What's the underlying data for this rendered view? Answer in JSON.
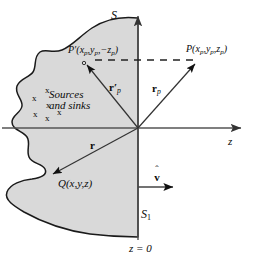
{
  "figure": {
    "name": "half-space-source-sink-image-point-diagram",
    "background_color": "#ffffff",
    "ink_color": "#0a0a0a",
    "region_fill_color": "#d9d9d9",
    "region_stroke_color": "#1a1a1a",
    "axis_color": "#555555"
  },
  "labels": {
    "surface_S": "S",
    "surface_S1_base": "S",
    "surface_S1_sub": "1",
    "point_P_prime": {
      "head": "P",
      "prime": "′",
      "open": "(",
      "x": "x",
      "x_sub": "p",
      "comma1": ",",
      "y": "y",
      "y_sub": "p",
      "comma2": ",",
      "z": "−z",
      "z_sub": "p",
      "close": ")",
      "full": "P′(xp ,yp ,−zp)"
    },
    "point_P": {
      "head": "P",
      "open": "(",
      "x": "x",
      "x_sub": "p",
      "comma1": ",",
      "y": "y",
      "y_sub": "p",
      "comma2": ",",
      "z": "z",
      "z_sub": "p",
      "close": ")",
      "full": "P(xp ,yp ,zp)"
    },
    "point_Q": {
      "head": "Q",
      "body": "(x,y,z)",
      "full": "Q(x,y,z)"
    },
    "sources_and_sinks_line1": "Sources",
    "sources_and_sinks_line2": "and sinks",
    "vector_r_prime_p": {
      "symbol": "r",
      "prime": "′",
      "sub": "p"
    },
    "vector_r_p": {
      "symbol": "r",
      "sub": "p"
    },
    "vector_r": {
      "symbol": "r"
    },
    "unit_normal_v": {
      "symbol": "v",
      "hat": "ˆ"
    },
    "axis_z": "z",
    "plane_equation": "z = 0"
  },
  "markers": {
    "source_sink_glyph": "x",
    "source_sink_count": 6
  },
  "geometry": {
    "origin": {
      "x": 138,
      "y": 128
    },
    "z_axis_end_x": 243,
    "vertical_axis_top_y": 14,
    "vertical_axis_bottom_y": 240,
    "dashed_line_y": 60,
    "dashed_line_from_x": 97,
    "dashed_line_to_x": 198,
    "P_prime_point": {
      "x": 84,
      "y": 64
    },
    "P_point": {
      "x": 198,
      "y": 62
    },
    "Q_point": {
      "x": 50,
      "y": 176
    },
    "normal_arrow": {
      "x1": 138,
      "y1": 187,
      "x2": 176,
      "y2": 187
    }
  }
}
